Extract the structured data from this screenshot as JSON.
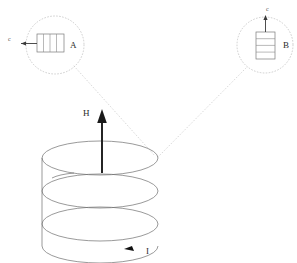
{
  "figure": {
    "background_color": "#ffffff",
    "width": 297,
    "height": 263
  },
  "main_coil": {
    "name": "helical-solenoid",
    "turns": 3,
    "stroke_color": "#6f6f6f",
    "center_x": 100,
    "top_y": 158,
    "radius_x": 58,
    "radius_y": 17,
    "turn_pitch": 33
  },
  "field_arrow": {
    "label": "H",
    "label_x": 83,
    "label_y": 113,
    "direction": "up",
    "color": "#1a1a1a",
    "base_x": 102,
    "base_y": 173,
    "tip_y": 110
  },
  "current_arrow": {
    "label": "I",
    "label_x": 146,
    "label_y": 253,
    "direction": "clockwise-front",
    "color": "#111111"
  },
  "insets": [
    {
      "id": "A",
      "label": "A",
      "label_x": 70,
      "label_y": 48,
      "circle_cx": 55,
      "circle_cy": 45,
      "circle_r": 29,
      "orientation": "horizontal",
      "coil_turns": 4,
      "arrow_label": "c",
      "arrow_label_x": 8,
      "arrow_label_y": 41,
      "arrow_direction": "left",
      "leader_from_x": 74,
      "leader_from_y": 66,
      "leader_to_x": 155,
      "leader_to_y": 156
    },
    {
      "id": "B",
      "label": "B",
      "label_x": 283,
      "label_y": 48,
      "circle_cx": 265,
      "circle_cy": 45,
      "circle_r": 28,
      "orientation": "vertical",
      "coil_turns": 4,
      "arrow_label": "c",
      "arrow_label_x": 266,
      "arrow_label_y": 9,
      "arrow_direction": "up",
      "leader_from_x": 246,
      "leader_from_y": 68,
      "leader_to_x": 158,
      "leader_to_y": 157
    }
  ],
  "colors": {
    "coil": "#6f6f6f",
    "inset_outline": "#7a7a7a",
    "dotted_guide": "#c6c6c6",
    "field_arrow": "#1a1a1a",
    "label_text": "#2b2b2b"
  }
}
